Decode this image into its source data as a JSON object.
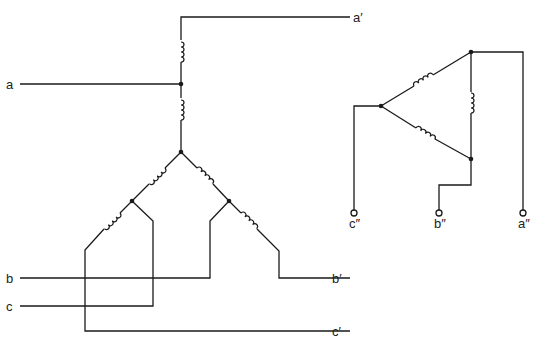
{
  "diagram": {
    "type": "transformer-winding-schematic",
    "colors": {
      "line": "#1a1a1a",
      "background": "#ffffff"
    },
    "left_circuit": {
      "terminals": {
        "input_a": "a",
        "input_b": "b",
        "input_c": "c",
        "output_a": "a′",
        "output_b": "b′",
        "output_c": "c′"
      },
      "coil_count": 6,
      "junction_count": 4
    },
    "right_circuit": {
      "terminals": {
        "a": "a″",
        "b": "b″",
        "c": "c″"
      },
      "coil_count": 3,
      "junction_count": 3
    }
  }
}
